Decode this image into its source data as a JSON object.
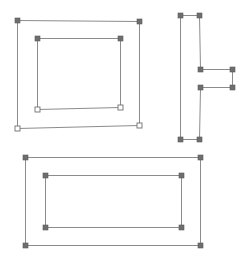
{
  "diagram": {
    "colors": {
      "edge": "#8c8c8c",
      "vertex_filled": "#6e6e6e",
      "vertex_hollow_fill": "#ffffff",
      "vertex_hollow_stroke": "#707070",
      "background": "#ffffff"
    },
    "shapes": [
      {
        "id": "top-left-outer",
        "vertices": [
          [
            17,
            20,
            "filled"
          ],
          [
            139,
            21,
            "filled"
          ],
          [
            139,
            125,
            "hollow"
          ],
          [
            17,
            128,
            "hollow"
          ]
        ]
      },
      {
        "id": "top-left-inner",
        "vertices": [
          [
            37,
            38,
            "filled"
          ],
          [
            120,
            38,
            "filled"
          ],
          [
            120,
            107,
            "hollow"
          ],
          [
            37,
            109,
            "hollow"
          ]
        ]
      },
      {
        "id": "right-notched",
        "vertices": [
          [
            180,
            15,
            "filled"
          ],
          [
            199,
            15,
            "filled"
          ],
          [
            200,
            69,
            "filled"
          ],
          [
            232,
            69,
            "filled"
          ],
          [
            232,
            87,
            "filled"
          ],
          [
            200,
            87,
            "filled"
          ],
          [
            199,
            139,
            "filled"
          ],
          [
            180,
            139,
            "filled"
          ]
        ]
      },
      {
        "id": "bottom-outer",
        "vertices": [
          [
            25,
            157,
            "filled"
          ],
          [
            200,
            157,
            "filled"
          ],
          [
            200,
            245,
            "filled"
          ],
          [
            25,
            245,
            "filled"
          ]
        ]
      },
      {
        "id": "bottom-inner",
        "vertices": [
          [
            45,
            175,
            "filled"
          ],
          [
            181,
            175,
            "filled"
          ],
          [
            181,
            227,
            "filled"
          ],
          [
            45,
            227,
            "filled"
          ]
        ]
      }
    ]
  }
}
